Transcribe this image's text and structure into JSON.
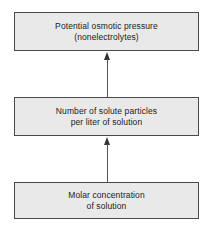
{
  "diagram": {
    "orientation": "bottom-to-top",
    "box_fill_color": "#e9e9e9",
    "box_border_color": "#4a4a4a",
    "arrow_color": "#333333",
    "text_color": "#1a1a1a",
    "background_color": "#ffffff",
    "boxes": [
      {
        "id": "potential-osmotic-pressure",
        "line1": "Potential osmotic pressure",
        "line2": "(nonelectrolytes)",
        "text": "Potential osmotic pressure\n(nonelectrolytes)"
      },
      {
        "id": "solute-particles",
        "line1": "Number of solute particles",
        "line2": "per liter of solution",
        "text": "Number of solute particles\nper liter of solution"
      },
      {
        "id": "molar-concentration",
        "line1": "Molar concentration",
        "line2": "of solution",
        "text": "Molar concentration\nof solution"
      }
    ],
    "arrows": [
      {
        "id": "molar-to-solute",
        "from": "molar-concentration",
        "to": "solute-particles",
        "direction": "up"
      },
      {
        "id": "solute-to-pressure",
        "from": "solute-particles",
        "to": "potential-osmotic-pressure",
        "direction": "up"
      }
    ]
  }
}
